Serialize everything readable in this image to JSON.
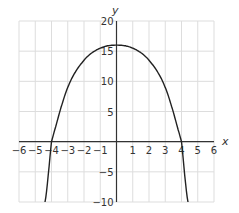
{
  "chart_data": {
    "type": "line",
    "title": "",
    "xlabel": "x",
    "ylabel": "y",
    "xlim": [
      -6,
      6
    ],
    "ylim": [
      -10,
      20
    ],
    "grid": true,
    "x_ticks": [
      -6,
      -5,
      -4,
      -3,
      -2,
      -1,
      1,
      2,
      3,
      4,
      5,
      6
    ],
    "y_ticks": [
      -10,
      -5,
      5,
      10,
      15,
      20
    ],
    "x_tick_labels": [
      "−6",
      "−5",
      "−4",
      "−3",
      "−2",
      "−1",
      "1",
      "2",
      "3",
      "4",
      "5",
      "6"
    ],
    "y_tick_labels": [
      "−10",
      "−5",
      "5",
      "10",
      "15",
      "20"
    ],
    "series": [
      {
        "name": "parabola",
        "description": "downward-opening curve with vertex near (0, 16) and x-intercepts at -4 and 4",
        "x": [
          -4.4,
          -4,
          -3,
          -2,
          -1,
          0,
          1,
          2,
          3,
          4,
          4.4
        ],
        "y": [
          -10,
          0,
          9,
          13.5,
          15.5,
          16,
          15.5,
          13.5,
          9,
          0,
          -10
        ]
      }
    ],
    "color": "#222222"
  }
}
